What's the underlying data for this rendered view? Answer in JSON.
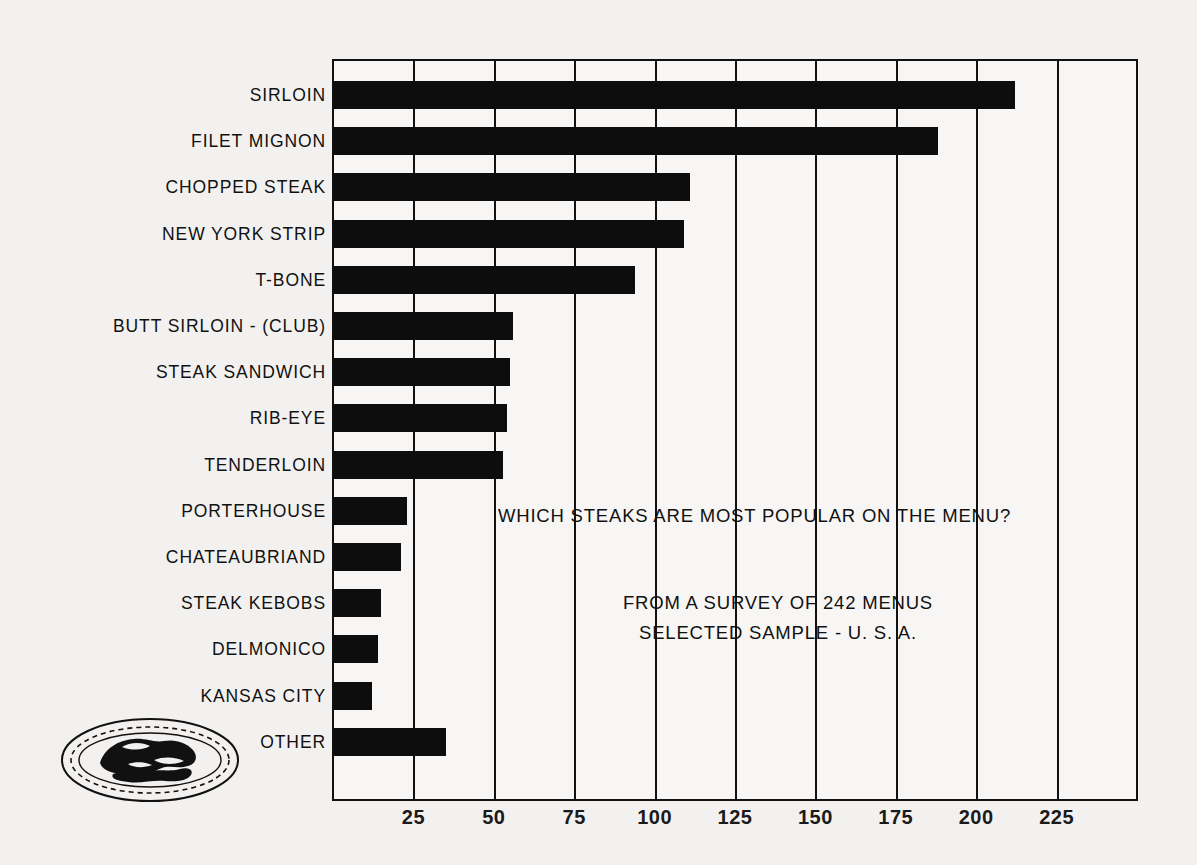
{
  "chart_data": {
    "type": "bar",
    "orientation": "horizontal",
    "title": "WHICH STEAKS ARE MOST POPULAR ON THE MENU?",
    "subtitle_lines": [
      "FROM A SURVEY OF 242 MENUS",
      "SELECTED SAMPLE - U. S. A."
    ],
    "xlabel": "",
    "ylabel": "",
    "categories": [
      "SIRLOIN",
      "FILET MIGNON",
      "CHOPPED STEAK",
      "NEW YORK STRIP",
      "T-BONE",
      "BUTT SIRLOIN - (CLUB)",
      "STEAK SANDWICH",
      "RIB-EYE",
      "TENDERLOIN",
      "PORTERHOUSE",
      "CHATEAUBRIAND",
      "STEAK KEBOBS",
      "DELMONICO",
      "KANSAS CITY",
      "OTHER"
    ],
    "values": [
      212,
      188,
      111,
      109,
      94,
      56,
      55,
      54,
      53,
      23,
      21,
      15,
      14,
      12,
      35
    ],
    "xlim": [
      0,
      250
    ],
    "xticks": [
      25,
      50,
      75,
      100,
      125,
      150,
      175,
      200,
      225
    ],
    "xtick_labels": [
      "25",
      "50",
      "75",
      "100",
      "125",
      "150",
      "175",
      "200",
      "225"
    ],
    "grid": true,
    "legend": "none",
    "bar_color": "#0d0d0d",
    "background_color": "#f3f1ef",
    "axis_color": "#111111"
  },
  "logo": {
    "name": "steak-platter-logo",
    "description": "oval platter with steak"
  }
}
